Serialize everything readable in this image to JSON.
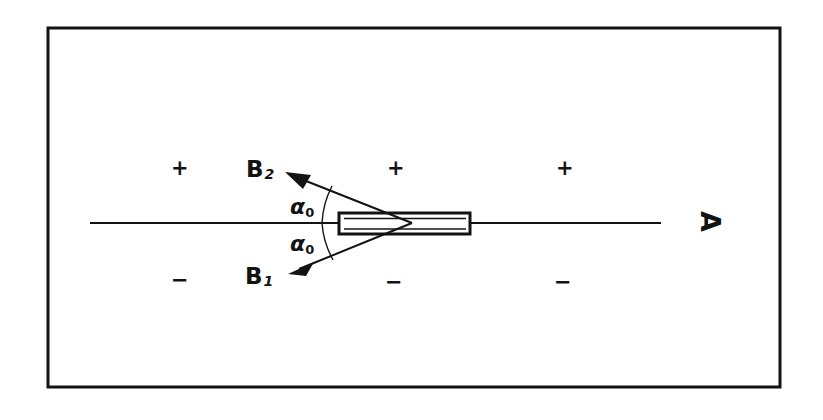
{
  "figure": {
    "background_color": "#ffffff",
    "ink_color": "#131313",
    "border": {
      "name": "outer-frame",
      "x": 48,
      "y": 28,
      "width": 732,
      "height": 359,
      "stroke_width": 3
    },
    "axis_line": {
      "name": "horizontal-axis",
      "x1": 90,
      "y1": 223,
      "x2": 661,
      "y2": 223,
      "stroke_width": 2
    },
    "magnet_bar": {
      "name": "magnet-bar",
      "x": 339,
      "y": 213,
      "width": 131,
      "height": 21,
      "stroke_width": 3
    },
    "vertex": {
      "x": 412,
      "y": 223
    },
    "rays": [
      {
        "name": "ray-b2",
        "label": "B",
        "subscript": "2",
        "x1": 412,
        "y1": 223,
        "x2": 287,
        "y2": 174
      },
      {
        "name": "ray-b1",
        "label": "B",
        "subscript": "1",
        "x1": 412,
        "y1": 223,
        "x2": 290,
        "y2": 272
      }
    ],
    "angle_arcs": [
      {
        "name": "angle-arc-upper",
        "label": "α",
        "subscript": "0"
      },
      {
        "name": "angle-arc-lower",
        "label": "α",
        "subscript": "0"
      }
    ],
    "angle_labels": [
      {
        "name": "angle-label-upper",
        "text": "α",
        "subscript": "0",
        "x": 290,
        "y": 196
      },
      {
        "name": "angle-label-lower",
        "text": "α",
        "subscript": "0",
        "x": 290,
        "y": 233
      }
    ],
    "b_labels": [
      {
        "name": "label-b2",
        "text": "B",
        "subscript": "2",
        "x": 246,
        "y": 158
      },
      {
        "name": "label-b1",
        "text": "B",
        "subscript": "1",
        "x": 245,
        "y": 265
      }
    ],
    "polarity_markers": [
      {
        "name": "plus-sign-left",
        "text": "+",
        "x": 171,
        "y": 158
      },
      {
        "name": "plus-sign-middle",
        "text": "+",
        "x": 387,
        "y": 158
      },
      {
        "name": "plus-sign-right",
        "text": "+",
        "x": 556,
        "y": 158
      },
      {
        "name": "minus-sign-left",
        "text": "−",
        "x": 171,
        "y": 270
      },
      {
        "name": "minus-sign-middle",
        "text": "−",
        "x": 385,
        "y": 272
      },
      {
        "name": "minus-sign-right",
        "text": "−",
        "x": 554,
        "y": 272
      }
    ],
    "axis_marker": {
      "name": "axis-label-a",
      "text": "A",
      "x": 700,
      "y": 208,
      "rotation_degrees": 90
    }
  }
}
